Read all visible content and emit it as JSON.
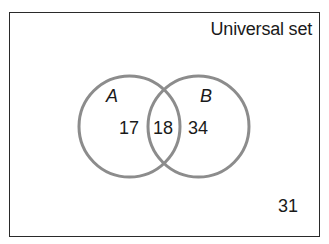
{
  "diagram": {
    "type": "venn",
    "universe": {
      "label": "Universal set",
      "outside_count": "31"
    },
    "sets": [
      {
        "name": "A",
        "label": "A",
        "only_count": "17"
      },
      {
        "name": "B",
        "label": "B",
        "only_count": "34"
      }
    ],
    "intersection": {
      "sets": [
        "A",
        "B"
      ],
      "count": "18"
    },
    "colors": {
      "circle_stroke": "#8c8c8c",
      "border": "#2a2a2a",
      "text": "#1a1a1a",
      "background": "#ffffff"
    }
  }
}
